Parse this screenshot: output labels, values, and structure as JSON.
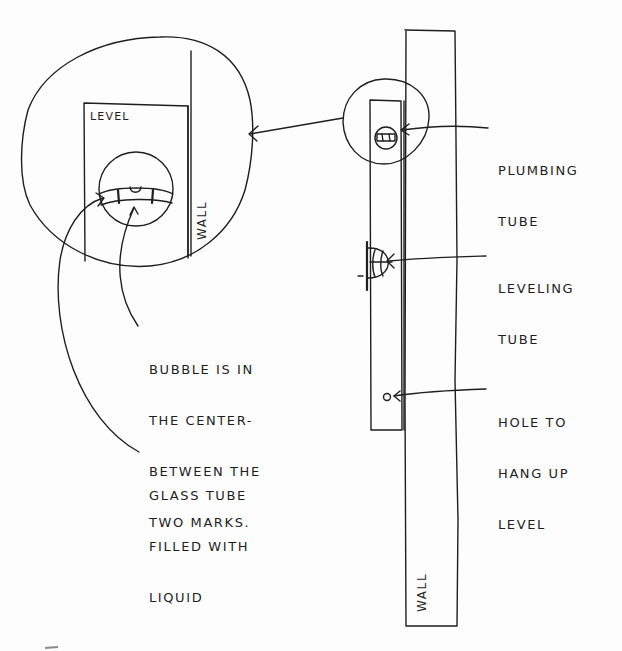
{
  "diagram": {
    "colors": {
      "ink": "#1e1e1e",
      "paper": "#fdfdfd"
    },
    "inset": {
      "level_label": "LEVEL",
      "wall_label": "WALL"
    },
    "main": {
      "wall_label": "WALL"
    },
    "callouts": {
      "plumbing_tube": [
        "PLUMBING",
        "TUBE"
      ],
      "leveling_tube": [
        "LEVELING",
        "TUBE"
      ],
      "hole": [
        "HOLE TO",
        "HANG UP",
        "LEVEL"
      ],
      "bubble": [
        "BUBBLE IS IN",
        "THE CENTER-",
        "BETWEEN THE",
        "TWO MARKS."
      ],
      "glass_tube": [
        "GLASS TUBE",
        "FILLED WITH",
        "LIQUID"
      ]
    }
  }
}
